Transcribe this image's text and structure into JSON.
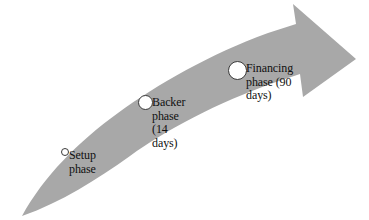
{
  "diagram": {
    "type": "curved-arrow-timeline",
    "background_color": "#ffffff",
    "arrow": {
      "fill_color": "#a8a8a8",
      "direction": "left-bottom-to-right-top",
      "description": "tapered curved gray arrow sweeping upward to the right ending in a right-pointing arrowhead"
    },
    "milestones": [
      {
        "id": "setup",
        "label": "Setup\nphase",
        "marker_size_px": 8,
        "marker_fill": "#ffffff",
        "marker_stroke": "#3a3a3a"
      },
      {
        "id": "backer",
        "label": "Backer\nphase (14\ndays)",
        "marker_size_px": 15,
        "marker_fill": "#ffffff",
        "marker_stroke": "#3a3a3a"
      },
      {
        "id": "financing",
        "label": "Financing\nphase (90\ndays)",
        "marker_size_px": 19,
        "marker_fill": "#ffffff",
        "marker_stroke": "#3a3a3a"
      }
    ]
  }
}
